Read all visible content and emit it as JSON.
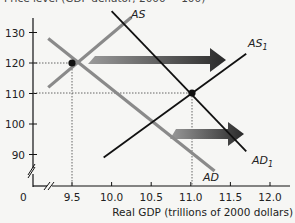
{
  "chart_data": {
    "type": "line",
    "title": "Price level (GDP deflator, 2000 = 100)",
    "xlabel": "Real GDP (trillions of 2000 dollars)",
    "ylabel": "Price level",
    "x_ticks": [
      "9.5",
      "10.0",
      "10.5",
      "11.0",
      "11.5",
      "12.0"
    ],
    "x_tick_values": [
      9.5,
      10.0,
      10.5,
      11.0,
      11.5,
      12.0
    ],
    "y_ticks": [
      "90",
      "100",
      "110",
      "120",
      "130"
    ],
    "y_tick_values": [
      90,
      100,
      110,
      120,
      130
    ],
    "origin_label": "0",
    "xlim": [
      9.2,
      12.2
    ],
    "ylim": [
      80,
      140
    ],
    "axis_breaks": true,
    "grid": false,
    "series": [
      {
        "name": "AS",
        "color": "#8a8a8a",
        "label": "AS",
        "points": [
          [
            9.2,
            112
          ],
          [
            10.25,
            135
          ]
        ]
      },
      {
        "name": "AD",
        "color": "#8a8a8a",
        "label": "AD",
        "points": [
          [
            9.2,
            128
          ],
          [
            11.3,
            84.6
          ]
        ]
      },
      {
        "name": "AS1",
        "color": "#111111",
        "label": "AS",
        "label_sub": "1",
        "points": [
          [
            9.9,
            89
          ],
          [
            11.7,
            123
          ]
        ]
      },
      {
        "name": "AD1",
        "color": "#111111",
        "label": "AD",
        "label_sub": "1",
        "points": [
          [
            10.0,
            137
          ],
          [
            11.7,
            91
          ]
        ]
      }
    ],
    "equilibria": [
      {
        "name": "initial",
        "x": 9.5,
        "y": 120
      },
      {
        "name": "new",
        "x": 11.0,
        "y": 110
      }
    ],
    "annotations": [
      {
        "type": "arrow",
        "description": "AS shifts rightward",
        "from": [
          10.0,
          121
        ],
        "to": [
          11.7,
          121
        ]
      },
      {
        "type": "arrow",
        "description": "AD shifts rightward",
        "from": [
          10.7,
          95
        ],
        "to": [
          11.4,
          95
        ]
      }
    ]
  }
}
